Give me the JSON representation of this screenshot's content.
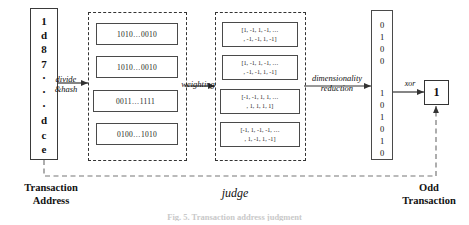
{
  "figure": {
    "caption": "Fig. 5.  Transaction address judgment",
    "bottom_labels": {
      "left": "Transaction\nAddress",
      "center": "judge",
      "right": "Odd\nTransaction"
    }
  },
  "transaction_address": {
    "name": "Transaction Address",
    "characters": [
      "1",
      "d",
      "8",
      "7",
      "·",
      "·",
      "·",
      "d",
      "c",
      "e"
    ]
  },
  "process_labels": {
    "divide_hash": "divide\n&hash",
    "divide_hash_line1": "divide",
    "divide_hash_line2": "&hash",
    "weighting": "weighting",
    "dimensionality_reduction_line1": "dimensionality",
    "dimensionality_reduction_line2": "reduction",
    "xor": "xor"
  },
  "hash_group": {
    "label": "hash segments",
    "items": [
      {
        "value": "1010…0010"
      },
      {
        "value": "1010…0010"
      },
      {
        "value": "0011…1111"
      },
      {
        "value": "0100…1010"
      }
    ]
  },
  "weighted_vectors": {
    "label": "weighted vectors",
    "items": [
      {
        "line1": "[1, -1, 1, -1, …",
        "line2": ", -1, -1, 1, -1]"
      },
      {
        "line1": "[1, -1, 1, -1, …",
        "line2": ", -1, -1, 1, -1]"
      },
      {
        "line1": "[-1, -1, 1, 1, …",
        "line2": ", 1, 1, 1, 1]"
      },
      {
        "line1": "[-1, 1, -1, -1, …",
        "line2": ", 1, -1, 1, -1]"
      }
    ]
  },
  "reduced_fingerprint": {
    "label": "reduced bit string",
    "digits_top": [
      "0",
      "1",
      "0",
      "0"
    ],
    "digits_bottom": [
      "1",
      "0",
      "1",
      "0",
      "1",
      "0"
    ]
  },
  "result": {
    "label": "Odd Transaction result",
    "value": "1"
  },
  "colors": {
    "stroke": "#333333",
    "box_border": "#4a4a4a",
    "text": "#111111",
    "background": "#ffffff"
  }
}
